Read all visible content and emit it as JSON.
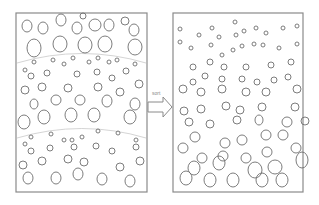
{
  "diagram": {
    "arrow": {
      "label": "sort"
    },
    "colors": {
      "frame": "#8a8a8a",
      "particle": "#6e6e6e",
      "boundary": "#c9c9c9",
      "background": "#ffffff"
    },
    "left_panel": {
      "name": "unsorted mixture",
      "frame": {
        "x": 16,
        "y": 13,
        "w": 131,
        "h": 179
      },
      "layer_boundaries": [
        {
          "x1": 17,
          "y1": 63,
          "cx": 82,
          "cy": 44,
          "x2": 146,
          "y2": 63
        },
        {
          "x1": 17,
          "y1": 138,
          "cx": 82,
          "cy": 119,
          "x2": 146,
          "y2": 138
        }
      ],
      "particles": [
        [
          27,
          26,
          5,
          6
        ],
        [
          43,
          28,
          5,
          6
        ],
        [
          61,
          20,
          5,
          6
        ],
        [
          77,
          28,
          5,
          6
        ],
        [
          95,
          25,
          6,
          6
        ],
        [
          109,
          25,
          5,
          6
        ],
        [
          125,
          21,
          4,
          4
        ],
        [
          134,
          30,
          5,
          6
        ],
        [
          83,
          16,
          3,
          3
        ],
        [
          34,
          48,
          7,
          9
        ],
        [
          60,
          44,
          7,
          8
        ],
        [
          85,
          45,
          7,
          8
        ],
        [
          105,
          44,
          7,
          8
        ],
        [
          135,
          47,
          7,
          8
        ],
        [
          34,
          62,
          2,
          2
        ],
        [
          53,
          60,
          2,
          2
        ],
        [
          64,
          64,
          2,
          2
        ],
        [
          73,
          58,
          2,
          2
        ],
        [
          89,
          62,
          2,
          2
        ],
        [
          98,
          58,
          2,
          2
        ],
        [
          109,
          62,
          2,
          2
        ],
        [
          117,
          60,
          2,
          2
        ],
        [
          135,
          64,
          2,
          2
        ],
        [
          25,
          70,
          2,
          2
        ],
        [
          31,
          76,
          3,
          3
        ],
        [
          47,
          73,
          3,
          3
        ],
        [
          77,
          74,
          3,
          3
        ],
        [
          97,
          72,
          3,
          3
        ],
        [
          112,
          78,
          3,
          3
        ],
        [
          126,
          71,
          3,
          3
        ],
        [
          25,
          90,
          4,
          4
        ],
        [
          42,
          87,
          4,
          4
        ],
        [
          68,
          88,
          4,
          4
        ],
        [
          98,
          87,
          4,
          4
        ],
        [
          120,
          92,
          4,
          4
        ],
        [
          139,
          84,
          4,
          4
        ],
        [
          34,
          104,
          4,
          5
        ],
        [
          56,
          100,
          5,
          5
        ],
        [
          80,
          100,
          5,
          5
        ],
        [
          107,
          101,
          5,
          6
        ],
        [
          135,
          104,
          5,
          6
        ],
        [
          24,
          122,
          6,
          7
        ],
        [
          44,
          117,
          6,
          7
        ],
        [
          71,
          115,
          6,
          7
        ],
        [
          94,
          115,
          6,
          7
        ],
        [
          130,
          117,
          6,
          7
        ],
        [
          31,
          137,
          2,
          2
        ],
        [
          51,
          134,
          2,
          2
        ],
        [
          64,
          140,
          2,
          2
        ],
        [
          72,
          140,
          2,
          2
        ],
        [
          82,
          137,
          2,
          2
        ],
        [
          98,
          131,
          2,
          2
        ],
        [
          118,
          133,
          2,
          2
        ],
        [
          136,
          140,
          2,
          2
        ],
        [
          25,
          144,
          2,
          2
        ],
        [
          31,
          151,
          3,
          3
        ],
        [
          50,
          148,
          3,
          3
        ],
        [
          74,
          147,
          3,
          3
        ],
        [
          96,
          146,
          3,
          3
        ],
        [
          112,
          151,
          3,
          3
        ],
        [
          136,
          147,
          3,
          3
        ],
        [
          23,
          165,
          4,
          4
        ],
        [
          42,
          161,
          4,
          4
        ],
        [
          68,
          159,
          4,
          4
        ],
        [
          84,
          162,
          4,
          4
        ],
        [
          120,
          167,
          4,
          4
        ],
        [
          140,
          161,
          4,
          4
        ],
        [
          28,
          178,
          5,
          6
        ],
        [
          56,
          178,
          5,
          6
        ],
        [
          78,
          174,
          5,
          6
        ],
        [
          102,
          179,
          5,
          6
        ],
        [
          130,
          181,
          5,
          6
        ]
      ]
    },
    "right_panel": {
      "name": "sorted by size",
      "frame": {
        "x": 173,
        "y": 13,
        "w": 130,
        "h": 179
      },
      "particles": [
        [
          180,
          29,
          2,
          2
        ],
        [
          199,
          35,
          2,
          2
        ],
        [
          212,
          28,
          2,
          2
        ],
        [
          219,
          37,
          2,
          2
        ],
        [
          236,
          35,
          2,
          2
        ],
        [
          244,
          31,
          2,
          2
        ],
        [
          256,
          28,
          2,
          2
        ],
        [
          266,
          33,
          2,
          2
        ],
        [
          283,
          28,
          2,
          2
        ],
        [
          297,
          26,
          2,
          2
        ],
        [
          235,
          22,
          2,
          2
        ],
        [
          180,
          42,
          2,
          2
        ],
        [
          191,
          48,
          2,
          2
        ],
        [
          211,
          45,
          2,
          2
        ],
        [
          222,
          55,
          2,
          2
        ],
        [
          233,
          50,
          2,
          2
        ],
        [
          242,
          46,
          2,
          2
        ],
        [
          254,
          44,
          2,
          2
        ],
        [
          263,
          45,
          2,
          2
        ],
        [
          279,
          48,
          2,
          2
        ],
        [
          297,
          44,
          2,
          2
        ],
        [
          193,
          67,
          3,
          3
        ],
        [
          210,
          62,
          3,
          3
        ],
        [
          224,
          67,
          3,
          3
        ],
        [
          246,
          67,
          3,
          3
        ],
        [
          271,
          65,
          3,
          3
        ],
        [
          291,
          62,
          3,
          3
        ],
        [
          193,
          82,
          3,
          3
        ],
        [
          205,
          76,
          3,
          3
        ],
        [
          222,
          79,
          3,
          3
        ],
        [
          242,
          79,
          3,
          3
        ],
        [
          257,
          82,
          3,
          3
        ],
        [
          274,
          80,
          3,
          3
        ],
        [
          288,
          77,
          3,
          3
        ],
        [
          183,
          89,
          4,
          4
        ],
        [
          201,
          92,
          4,
          4
        ],
        [
          222,
          89,
          4,
          4
        ],
        [
          246,
          92,
          4,
          4
        ],
        [
          266,
          92,
          4,
          4
        ],
        [
          297,
          89,
          4,
          4
        ],
        [
          184,
          111,
          4,
          4
        ],
        [
          201,
          109,
          4,
          4
        ],
        [
          226,
          106,
          4,
          4
        ],
        [
          240,
          110,
          4,
          4
        ],
        [
          262,
          107,
          4,
          4
        ],
        [
          295,
          107,
          4,
          4
        ],
        [
          189,
          122,
          4,
          4
        ],
        [
          210,
          124,
          4,
          4
        ],
        [
          237,
          120,
          4,
          4
        ],
        [
          259,
          120,
          4,
          5
        ],
        [
          287,
          122,
          5,
          5
        ],
        [
          305,
          121,
          4,
          4
        ],
        [
          195,
          137,
          5,
          5
        ],
        [
          225,
          143,
          5,
          5
        ],
        [
          242,
          140,
          5,
          5
        ],
        [
          266,
          135,
          5,
          5
        ],
        [
          283,
          135,
          5,
          5
        ],
        [
          183,
          148,
          5,
          5
        ],
        [
          202,
          158,
          5,
          5
        ],
        [
          223,
          156,
          5,
          5
        ],
        [
          246,
          158,
          5,
          5
        ],
        [
          267,
          152,
          5,
          5
        ],
        [
          296,
          148,
          5,
          5
        ],
        [
          194,
          168,
          6,
          7
        ],
        [
          219,
          163,
          6,
          7
        ],
        [
          255,
          170,
          7,
          8
        ],
        [
          275,
          167,
          7,
          7
        ],
        [
          302,
          160,
          6,
          8
        ],
        [
          186,
          178,
          6,
          7
        ],
        [
          210,
          180,
          6,
          7
        ],
        [
          233,
          180,
          6,
          7
        ],
        [
          262,
          180,
          6,
          7
        ],
        [
          282,
          180,
          6,
          7
        ]
      ]
    }
  }
}
